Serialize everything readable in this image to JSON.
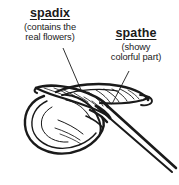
{
  "figure": {
    "caption_type": "botanical-line-drawing",
    "background_color": "#ffffff",
    "ink_color": "#1a1a1a"
  },
  "annotations": [
    {
      "id": "spadix",
      "title": "spadix",
      "description_lines": [
        "(contains the",
        "real flowers)"
      ],
      "leader_line": {
        "from_x": 63,
        "from_y": 48,
        "to_x": 81,
        "to_y": 90
      }
    },
    {
      "id": "spathe",
      "title": "spathe",
      "description_lines": [
        "(showy",
        "colorful part)"
      ],
      "leader_line": {
        "from_x": 129,
        "from_y": 71,
        "to_x": 112,
        "to_y": 104
      }
    }
  ]
}
